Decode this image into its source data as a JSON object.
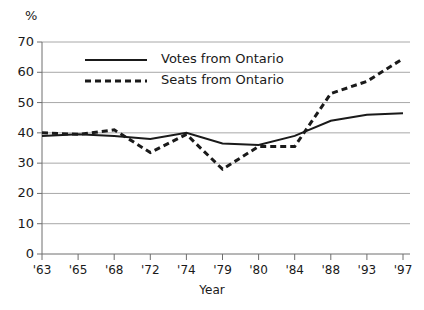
{
  "chart_data": {
    "type": "line",
    "title": "",
    "subtitle": "",
    "unit_label": "%",
    "xlabel": "Year",
    "ylabel": "",
    "categories": [
      "'63",
      "'65",
      "'68",
      "'72",
      "'74",
      "'79",
      "'80",
      "'84",
      "'88",
      "'93",
      "'97"
    ],
    "x_tick_labels": [
      "'63",
      "'65",
      "'68",
      "'72",
      "'74",
      "'79",
      "'80",
      "'84",
      "'88",
      "'93",
      "'97"
    ],
    "y_tick_labels": [
      "0",
      "10",
      "20",
      "30",
      "40",
      "50",
      "60",
      "70"
    ],
    "y_ticks": [
      0,
      10,
      20,
      30,
      40,
      50,
      60,
      70
    ],
    "ylim": [
      0,
      70
    ],
    "grid": "horizontal",
    "legend_position": "upper-left-inside",
    "series": [
      {
        "name": "Votes from Ontario",
        "style": "solid",
        "color": "#1a1a1a",
        "values": [
          39,
          39.5,
          39,
          38,
          40,
          36.5,
          36,
          39,
          44,
          46,
          46.5
        ]
      },
      {
        "name": "Seats from Ontario",
        "style": "dashed",
        "color": "#1a1a1a",
        "values": [
          40,
          39.5,
          41,
          33.5,
          39.5,
          28,
          35.5,
          35.5,
          53,
          57,
          64.5
        ]
      }
    ]
  },
  "legend": {
    "items": [
      {
        "label": "Votes from Ontario",
        "style": "solid"
      },
      {
        "label": "Seats from Ontario",
        "style": "dashed"
      }
    ]
  },
  "colors": {
    "line": "#1a1a1a",
    "grid": "#a8a8a8",
    "axis": "#6e6e6e",
    "background": "#ffffff"
  }
}
